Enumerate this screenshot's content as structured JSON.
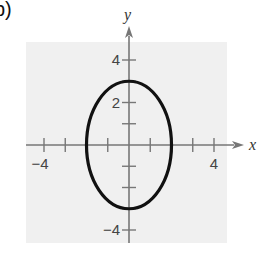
{
  "panel_label": "b)",
  "chart_data": {
    "type": "line",
    "title": "",
    "xlabel": "x",
    "ylabel": "y",
    "xlim": [
      -4.8,
      4.6
    ],
    "ylim": [
      -4.6,
      4.8
    ],
    "x_tick_values": [
      -4,
      -3,
      -2,
      -1,
      1,
      2,
      3,
      4
    ],
    "y_tick_values": [
      -4,
      -3,
      -2,
      -1,
      1,
      2,
      3,
      4
    ],
    "x_tick_labels": [
      {
        "value": -4,
        "label": "−4"
      },
      {
        "value": 4,
        "label": "4"
      }
    ],
    "y_tick_labels": [
      {
        "value": 4,
        "label": "4"
      },
      {
        "value": 2,
        "label": "2"
      },
      {
        "value": -4,
        "label": "−4"
      }
    ],
    "grid": false,
    "background": "#f0f0f0",
    "series": [
      {
        "name": "ellipse",
        "shape": "ellipse",
        "center": [
          0,
          0
        ],
        "semi_axis_x": 2,
        "semi_axis_y": 3,
        "equation": "x^2/4 + y^2/9 = 1",
        "color": "#111111"
      }
    ]
  },
  "colors": {
    "panel_bg": "#f0f0f0",
    "axis": "#777777",
    "curve": "#111111",
    "text": "#333333"
  }
}
